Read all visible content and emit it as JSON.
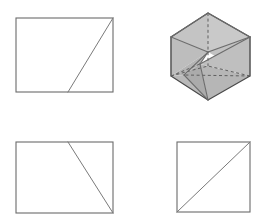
{
  "page": {
    "background_color": "#ffffff",
    "width": 273,
    "height": 222
  },
  "palette": {
    "outline_stroke": "#6b6b6b",
    "solid_outline_stroke": "#4a4a4a",
    "hidden_edge_stroke": "#5f5f5f",
    "face_light": "#c9c9c9",
    "face_mid": "#bcbcbc",
    "face_dark": "#adadad",
    "face_darker": "#a2a2a2",
    "background": "#ffffff"
  },
  "figures": [
    {
      "id": "figure-top-left",
      "name": "rectangle-with-diagonal-upper-left",
      "type": "rectangle",
      "label": "Rectangle with partial diagonal",
      "shading": "none",
      "rect": {
        "x": 16,
        "y": 18,
        "width": 97,
        "height": 74
      },
      "diagonal": {
        "x1": 113,
        "y1": 18,
        "x2": 68,
        "y2": 92
      },
      "diagonal_description": "line from top-right corner to a point on the bottom edge"
    },
    {
      "id": "figure-top-right",
      "name": "shaded-polyhedron",
      "type": "polyhedron",
      "label": "Shaded hexagonal polyhedron with hidden edges",
      "shading": "gray-faces",
      "outline_points": "208,13 250,37 250,76 208,100 171,76 171,37",
      "faces": [
        {
          "name": "face-top-left",
          "points": "208,13 171,37 208,52",
          "fill": "#c4c4c4"
        },
        {
          "name": "face-top-right",
          "points": "208,13 250,37 208,52",
          "fill": "#c9c9c9"
        },
        {
          "name": "face-upper-band-left",
          "points": "171,37 208,52 171,76",
          "fill": "#bdbdbd"
        },
        {
          "name": "face-upper-band-right",
          "points": "250,37 250,76 208,52",
          "fill": "#c2c2c2"
        },
        {
          "name": "face-mid-left",
          "points": "171,76 208,52 200,64 184,75",
          "fill": "#b4b4b4"
        },
        {
          "name": "face-lower-left",
          "points": "171,76 184,75 208,100",
          "fill": "#b9b9b9"
        },
        {
          "name": "face-lower-mid",
          "points": "184,75 200,64 208,100",
          "fill": "#ababab"
        },
        {
          "name": "face-lower-right",
          "points": "200,64 250,76 208,100",
          "fill": "#b6b6b6"
        },
        {
          "name": "face-right-wedge",
          "points": "250,37 250,76 200,64",
          "fill": "#bfbfbf"
        }
      ],
      "visible_edges": [
        {
          "name": "outline",
          "points": "208,13 250,37 250,76 208,100 171,76 171,37 208,13"
        },
        {
          "name": "edge-apex-to-left-shoulder",
          "points": "208,13 171,37"
        },
        {
          "name": "edge-apex-to-right-shoulder",
          "points": "208,13 250,37"
        },
        {
          "name": "edge-left-shoulder-to-center",
          "points": "171,37 208,52"
        },
        {
          "name": "edge-center-to-right-shoulder",
          "points": "208,52 250,37"
        },
        {
          "name": "edge-left-shoulder-down",
          "points": "171,37 171,76"
        },
        {
          "name": "edge-right-shoulder-down",
          "points": "250,37 250,76"
        },
        {
          "name": "edge-center-to-lower-left",
          "points": "208,52 184,75"
        },
        {
          "name": "edge-center-node-to-bottom",
          "points": "184,75 208,100"
        },
        {
          "name": "edge-center-to-lower-right",
          "points": "208,52 200,64"
        },
        {
          "name": "edge-lower-right-node-to-bottom",
          "points": "200,64 208,100"
        },
        {
          "name": "edge-right-shoulder-to-lower-right-node",
          "points": "250,37 200,64"
        }
      ],
      "hidden_edges": [
        {
          "name": "hidden-vertical-axis",
          "points": "208,13 208,66"
        },
        {
          "name": "hidden-left-diagonal",
          "points": "171,76 208,66"
        },
        {
          "name": "hidden-right-diagonal",
          "points": "250,76 208,66"
        },
        {
          "name": "hidden-left-lower",
          "points": "171,76 200,64"
        },
        {
          "name": "hidden-right-lower",
          "points": "250,76 184,75"
        }
      ]
    },
    {
      "id": "figure-bottom-left",
      "name": "rectangle-with-diagonal-lower-right",
      "type": "rectangle",
      "label": "Rectangle with partial diagonal descending right",
      "shading": "none",
      "rect": {
        "x": 16,
        "y": 142,
        "width": 97,
        "height": 71
      },
      "diagonal": {
        "x1": 68,
        "y1": 142,
        "x2": 113,
        "y2": 213
      },
      "diagonal_description": "line from a point on the top edge to the bottom-right corner"
    },
    {
      "id": "figure-bottom-right",
      "name": "square-with-full-diagonal",
      "type": "square",
      "label": "Square with corner-to-corner diagonal",
      "shading": "none",
      "rect": {
        "x": 177,
        "y": 142,
        "width": 73,
        "height": 70
      },
      "diagonal": {
        "x1": 177,
        "y1": 212,
        "x2": 250,
        "y2": 142
      },
      "diagonal_description": "line from bottom-left corner to top-right corner"
    }
  ]
}
